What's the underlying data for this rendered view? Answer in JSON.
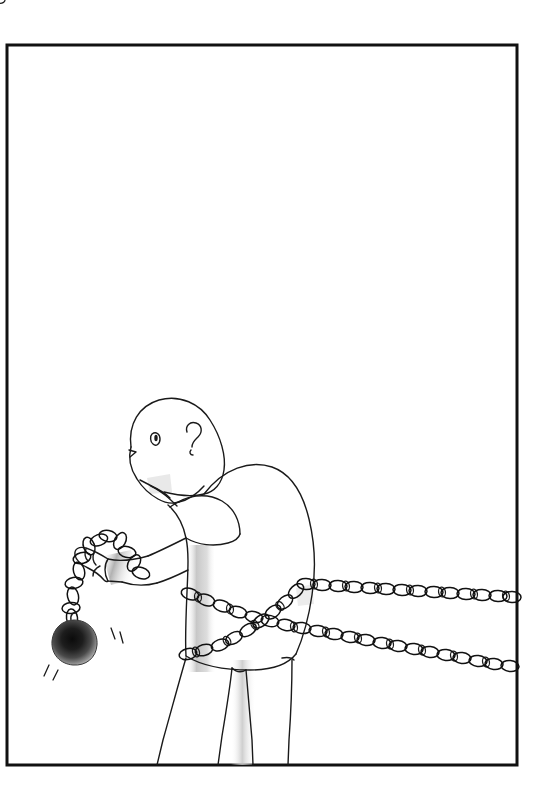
{
  "artwork": {
    "title": "Man dragging ball and chain",
    "medium": "black and white line drawing",
    "caption": "",
    "background_color": "#ffffff",
    "line_color": "#1a1a1a",
    "shading_color": "#d6d6d6",
    "ball_color": "#1c1c1c"
  },
  "frame": {
    "name": "page-border",
    "left": 7,
    "top": 45,
    "right": 517,
    "bottom": 765,
    "stroke_color": "#111111",
    "stroke_width": 3
  },
  "figure": {
    "name": "chained-man",
    "pose": "hunched forward, leaning left, walking right",
    "parts": [
      {
        "name": "head",
        "label": "bald egg-shaped head"
      },
      {
        "name": "eye",
        "label": "single oval eye"
      },
      {
        "name": "ear",
        "label": "question-mark shaped ear"
      },
      {
        "name": "jaw",
        "label": "jaw and chin line"
      },
      {
        "name": "neck",
        "label": "neck"
      },
      {
        "name": "torso",
        "label": "hunched back in t-shirt"
      },
      {
        "name": "sleeve",
        "label": "short sleeve"
      },
      {
        "name": "left-arm",
        "label": "bent arm holding chain"
      },
      {
        "name": "fist",
        "label": "clenched fist gripping chain link"
      },
      {
        "name": "hips",
        "label": "hip line"
      },
      {
        "name": "legs",
        "label": "two trouser legs running off bottom of frame"
      }
    ]
  },
  "objects": [
    {
      "name": "ball-and-chain",
      "label": "iron ball on short chain held in the fist",
      "ball_center_x": 74,
      "ball_center_y": 642,
      "ball_radius": 22,
      "motion_lines": 4
    },
    {
      "name": "chain-upper",
      "label": "upper chain crossing torso and running to right edge",
      "exits_frame": true
    },
    {
      "name": "chain-lower",
      "label": "lower chain crossing torso and running to right edge",
      "exits_frame": true
    },
    {
      "name": "chain-shoulder",
      "label": "chain segment over the shoulder behind the back",
      "exits_frame": false
    }
  ],
  "shading_regions": [
    {
      "name": "torso-shadow",
      "label": "vertical gray band on torso"
    },
    {
      "name": "forearm-shadow",
      "label": "gray band across forearm"
    },
    {
      "name": "leg-shadow",
      "label": "gray band on near leg"
    },
    {
      "name": "ball-shadow",
      "label": "radial dark gradient on iron ball"
    }
  ]
}
